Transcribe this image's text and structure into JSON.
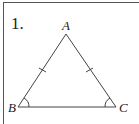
{
  "problem": {
    "number": "1."
  },
  "triangle": {
    "vertices": {
      "A": "A",
      "B": "B",
      "C": "C"
    },
    "congruent_sides": [
      "AB",
      "AC"
    ],
    "congruent_angles": [
      "B",
      "C"
    ]
  }
}
